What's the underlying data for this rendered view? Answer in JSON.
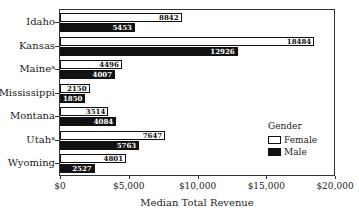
{
  "chart_data": {
    "type": "bar",
    "orientation": "horizontal",
    "title": "",
    "xlabel": "Median Total Revenue",
    "ylabel": "",
    "xlim": [
      0,
      20000
    ],
    "x_ticks": [
      "$0",
      "$5,000",
      "$10,000",
      "$15,000",
      "$20,000"
    ],
    "categories": [
      "Idaho",
      "Kansas",
      "Maineᵃ",
      "Mississippi",
      "Montana",
      "Utahᵃ",
      "Wyoming"
    ],
    "series": [
      {
        "name": "Female",
        "color": "#ffffff",
        "values": [
          8842,
          18484,
          4496,
          2150,
          3514,
          7647,
          4801
        ]
      },
      {
        "name": "Male",
        "color": "#111111",
        "values": [
          5453,
          12926,
          4007,
          1850,
          4084,
          5763,
          2527
        ]
      }
    ],
    "legend": {
      "title": "Gender",
      "position": "right-inside",
      "entries": [
        "Female",
        "Male"
      ]
    },
    "grid": false,
    "data_labels": true
  },
  "labels": {
    "cat0": "Idaho",
    "cat1": "Kansas",
    "cat2": "Maineᵃ",
    "cat3": "Mississippi",
    "cat4": "Montana",
    "cat5": "Utahᵃ",
    "cat6": "Wyoming",
    "f0": "8842",
    "f1": "18484",
    "f2": "4496",
    "f3": "2150",
    "f4": "3514",
    "f5": "7647",
    "f6": "4801",
    "m0": "5453",
    "m1": "12926",
    "m2": "4007",
    "m3": "1850",
    "m4": "4084",
    "m5": "5763",
    "m6": "2527",
    "x0": "$0",
    "x1": "$5,000",
    "x2": "$10,000",
    "x3": "$15,000",
    "x4": "$20,000",
    "xlabel": "Median Total Revenue",
    "legend_title": "Gender",
    "legend_female": "Female",
    "legend_male": "Male"
  }
}
